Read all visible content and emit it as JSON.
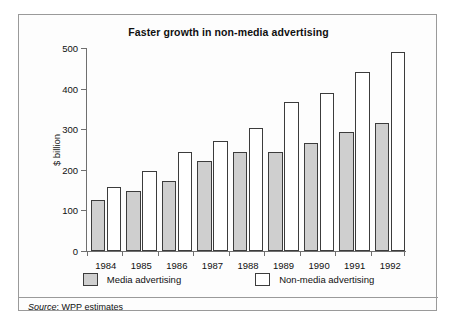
{
  "chart_data": {
    "type": "bar",
    "title": "Faster growth in non-media advertising",
    "xlabel": "",
    "ylabel": "$ billion",
    "categories": [
      "1984",
      "1985",
      "1986",
      "1987",
      "1988",
      "1989",
      "1990",
      "1991",
      "1992"
    ],
    "series": [
      {
        "name": "Media advertising",
        "color": "#cfcfcf",
        "values": [
          125,
          148,
          172,
          222,
          243,
          243,
          267,
          292,
          316
        ]
      },
      {
        "name": "Non-media advertising",
        "color": "#ffffff",
        "values": [
          157,
          197,
          245,
          270,
          303,
          368,
          390,
          441,
          489
        ]
      }
    ],
    "ylim": [
      0,
      500
    ],
    "yticks": [
      0,
      100,
      200,
      300,
      400,
      500
    ],
    "ytick_labels": [
      "0",
      "100",
      "200",
      "300",
      "400",
      "500"
    ],
    "grid": false,
    "legend_position": "bottom"
  },
  "source": {
    "prefix": "Source",
    "separator": ": ",
    "text": "WPP estimates"
  }
}
